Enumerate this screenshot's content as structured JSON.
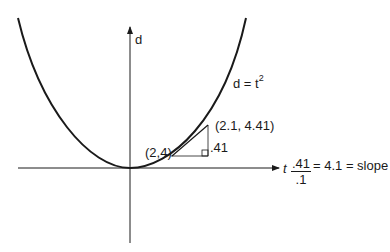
{
  "diagram": {
    "title": "",
    "axes": {
      "x_label": "t",
      "y_label": "d"
    },
    "curve": {
      "label_base": "d = t",
      "label_exponent": "2"
    },
    "points": [
      {
        "label": "(2,4)"
      },
      {
        "label": "(2.1, 4.41)"
      }
    ],
    "rise_label": ".41",
    "slope": {
      "numerator": ".41",
      "denominator": ".1",
      "result": "= 4.1 = slope"
    },
    "colors": {
      "ink": "#1a1a1a",
      "background": "#ffffff"
    }
  }
}
